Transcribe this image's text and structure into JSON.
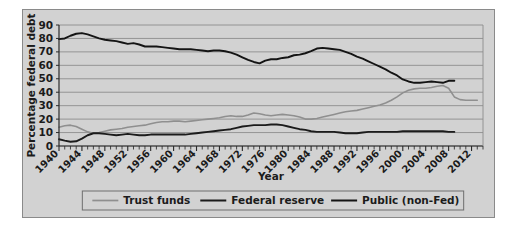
{
  "figure": {
    "background": "#ffffff",
    "panel_background": "#d2d2d2",
    "panel_border": "#8a8a8a"
  },
  "chart_data": {
    "type": "line",
    "title": "",
    "xlabel": "Year",
    "ylabel": "Percentage federal debt",
    "xlim": [
      1940,
      2014
    ],
    "ylim": [
      0,
      90
    ],
    "yticks": [
      0,
      10,
      20,
      30,
      40,
      50,
      60,
      70,
      80,
      90
    ],
    "xticks": [
      1940,
      1944,
      1948,
      1952,
      1956,
      1960,
      1964,
      1968,
      1972,
      1976,
      1980,
      1984,
      1988,
      1992,
      1996,
      2000,
      2004,
      2008,
      2012
    ],
    "minor_tick_interval": 1,
    "grid": "horizontal",
    "legend_position": "bottom",
    "series": [
      {
        "name": "Trust funds",
        "color": "#8f8f8f",
        "x": [
          1940,
          1941,
          1942,
          1943,
          1944,
          1945,
          1946,
          1947,
          1948,
          1949,
          1950,
          1951,
          1952,
          1953,
          1954,
          1955,
          1956,
          1957,
          1958,
          1959,
          1960,
          1961,
          1962,
          1963,
          1964,
          1965,
          1966,
          1967,
          1968,
          1969,
          1970,
          1971,
          1972,
          1973,
          1974,
          1975,
          1976,
          1977,
          1978,
          1979,
          1980,
          1981,
          1982,
          1983,
          1984,
          1985,
          1986,
          1987,
          1988,
          1989,
          1990,
          1991,
          1992,
          1993,
          1994,
          1995,
          1996,
          1997,
          1998,
          1999,
          2000,
          2001,
          2002,
          2003,
          2004,
          2005,
          2006,
          2007,
          2008,
          2009,
          2010,
          2011,
          2012,
          2013
        ],
        "values": [
          14.0,
          15.0,
          15.5,
          14.5,
          12.5,
          10.5,
          9.5,
          10.0,
          11.0,
          12.0,
          12.5,
          13.0,
          14.0,
          14.5,
          15.0,
          15.5,
          16.5,
          17.5,
          18.0,
          18.0,
          18.5,
          18.5,
          18.0,
          18.5,
          19.0,
          19.5,
          20.0,
          20.5,
          21.0,
          22.0,
          22.5,
          22.0,
          22.0,
          23.0,
          24.5,
          24.0,
          23.0,
          22.5,
          23.0,
          23.5,
          23.0,
          22.5,
          21.5,
          20.0,
          20.0,
          20.5,
          21.5,
          22.5,
          23.5,
          24.5,
          25.5,
          26.0,
          26.5,
          27.5,
          28.5,
          29.5,
          30.5,
          32.0,
          34.0,
          36.5,
          39.5,
          41.5,
          42.5,
          43.0,
          43.0,
          43.5,
          44.5,
          45.0,
          43.0,
          36.5,
          34.5,
          34.0,
          34.0,
          34.0
        ]
      },
      {
        "name": "Federal reserve",
        "color": "#1b1b1b",
        "x": [
          1940,
          1941,
          1942,
          1943,
          1944,
          1945,
          1946,
          1947,
          1948,
          1949,
          1950,
          1951,
          1952,
          1953,
          1954,
          1955,
          1956,
          1957,
          1958,
          1959,
          1960,
          1961,
          1962,
          1963,
          1964,
          1965,
          1966,
          1967,
          1968,
          1969,
          1970,
          1971,
          1972,
          1973,
          1974,
          1975,
          1976,
          1977,
          1978,
          1979,
          1980,
          1981,
          1982,
          1983,
          1984,
          1985,
          1986,
          1987,
          1988,
          1989,
          1990,
          1991,
          1992,
          1993,
          1994,
          1995,
          1996,
          1997,
          1998,
          1999,
          2000,
          2001,
          2002,
          2003,
          2004,
          2005,
          2006,
          2007,
          2008,
          2009
        ],
        "values": [
          5.0,
          4.0,
          3.2,
          3.5,
          5.5,
          8.0,
          9.5,
          9.5,
          9.0,
          8.5,
          8.0,
          8.5,
          9.0,
          8.5,
          8.0,
          8.0,
          8.5,
          8.5,
          8.5,
          8.5,
          8.5,
          8.5,
          8.5,
          9.0,
          9.5,
          10.0,
          10.5,
          11.0,
          11.5,
          12.0,
          12.5,
          13.5,
          14.5,
          15.0,
          15.5,
          15.5,
          15.5,
          16.0,
          16.0,
          15.5,
          14.5,
          13.5,
          12.5,
          12.0,
          11.0,
          10.5,
          10.5,
          10.5,
          10.5,
          10.0,
          9.5,
          9.5,
          9.5,
          10.0,
          10.5,
          10.5,
          10.5,
          10.5,
          10.5,
          10.5,
          11.0,
          11.0,
          11.0,
          11.0,
          11.0,
          11.0,
          11.0,
          11.0,
          10.5,
          10.5
        ]
      },
      {
        "name": "Public (non-Fed)",
        "color": "#141414",
        "x": [
          1940,
          1941,
          1942,
          1943,
          1944,
          1945,
          1946,
          1947,
          1948,
          1949,
          1950,
          1951,
          1952,
          1953,
          1954,
          1955,
          1956,
          1957,
          1958,
          1959,
          1960,
          1961,
          1962,
          1963,
          1964,
          1965,
          1966,
          1967,
          1968,
          1969,
          1970,
          1971,
          1972,
          1973,
          1974,
          1975,
          1976,
          1977,
          1978,
          1979,
          1980,
          1981,
          1982,
          1983,
          1984,
          1985,
          1986,
          1987,
          1988,
          1989,
          1990,
          1991,
          1992,
          1993,
          1994,
          1995,
          1996,
          1997,
          1998,
          1999,
          2000,
          2001,
          2002,
          2003,
          2004,
          2005,
          2006,
          2007,
          2008,
          2009
        ],
        "values": [
          79.5,
          80.0,
          82.0,
          83.5,
          84.0,
          83.0,
          81.5,
          80.0,
          79.0,
          78.5,
          78.0,
          77.0,
          76.0,
          76.5,
          75.5,
          74.0,
          74.0,
          74.0,
          73.5,
          73.0,
          72.5,
          72.0,
          72.0,
          72.0,
          71.5,
          71.0,
          70.5,
          71.0,
          71.0,
          70.5,
          69.5,
          68.0,
          66.0,
          64.0,
          62.5,
          61.5,
          63.5,
          64.5,
          64.5,
          65.5,
          66.0,
          67.5,
          68.0,
          69.0,
          70.5,
          72.5,
          73.0,
          72.5,
          72.0,
          71.5,
          70.0,
          68.5,
          66.5,
          65.0,
          63.0,
          61.0,
          59.0,
          57.0,
          54.5,
          52.5,
          49.5,
          48.0,
          47.0,
          47.0,
          47.5,
          48.0,
          47.5,
          47.0,
          48.5,
          48.5
        ]
      }
    ]
  },
  "axes": {
    "ylabel": "Percentage federal debt",
    "xlabel": "Year",
    "ytick_labels": [
      "0",
      "10",
      "20",
      "30",
      "40",
      "50",
      "60",
      "70",
      "80",
      "90"
    ],
    "xtick_labels": [
      "1940",
      "1944",
      "1948",
      "1952",
      "1956",
      "1960",
      "1964",
      "1968",
      "1972",
      "1976",
      "1980",
      "1984",
      "1988",
      "1992",
      "1996",
      "2000",
      "2004",
      "2008",
      "2012"
    ]
  },
  "legend": {
    "items": [
      {
        "label": "Trust funds",
        "color": "#8f8f8f"
      },
      {
        "label": "Federal reserve",
        "color": "#1b1b1b"
      },
      {
        "label": "Public (non-Fed)",
        "color": "#141414"
      }
    ]
  }
}
